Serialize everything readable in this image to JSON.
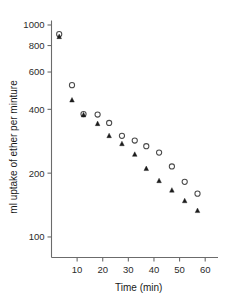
{
  "chart_data": {
    "type": "scatter",
    "title": "",
    "xlabel": "Time (min)",
    "ylabel": "ml uptake of ether per minture",
    "yscale": "log",
    "xscale": "linear",
    "xlim": [
      0,
      65
    ],
    "ylim": [
      80,
      1050
    ],
    "grid": false,
    "legend": "none",
    "xticks": [
      10,
      20,
      30,
      40,
      50,
      60
    ],
    "xtick_labels": [
      "10",
      "20",
      "30",
      "40",
      "50",
      "60"
    ],
    "yticks": [
      100,
      200,
      400,
      600,
      800,
      1000
    ],
    "ytick_labels": [
      "100",
      "200",
      "400",
      "600",
      "800",
      "1000"
    ],
    "series": [
      {
        "name": "open-circles",
        "marker": "open-circle",
        "color": "#4a4a4a",
        "x": [
          3,
          8,
          12.5,
          18,
          22.5,
          27.5,
          32.5,
          37,
          42,
          47,
          52,
          57
        ],
        "y": [
          905,
          520,
          380,
          378,
          345,
          300,
          285,
          268,
          250,
          215,
          182,
          160
        ]
      },
      {
        "name": "filled-triangles",
        "marker": "filled-triangle",
        "color": "#1c1c1c",
        "x": [
          3,
          8,
          12.5,
          18,
          22.5,
          27.5,
          32.5,
          37,
          42,
          47,
          52,
          57
        ],
        "y": [
          880,
          442,
          376,
          342,
          300,
          275,
          245,
          210,
          184,
          166,
          148,
          133
        ]
      }
    ]
  }
}
